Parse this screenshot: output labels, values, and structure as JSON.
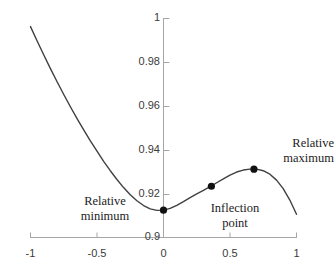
{
  "chart_data": {
    "type": "line",
    "title": "",
    "xlabel": "",
    "ylabel": "",
    "xlim": [
      -1,
      1
    ],
    "ylim": [
      0.9,
      1.0
    ],
    "grid": false,
    "legend": null,
    "xticks": [
      -1,
      -0.5,
      0,
      0.5,
      1
    ],
    "xtick_labels": [
      "-1",
      "-0.5",
      "0",
      "0.5",
      "1"
    ],
    "yticks": [
      0.9,
      0.92,
      0.94,
      0.96,
      0.98,
      1
    ],
    "ytick_labels": [
      "0.9",
      "0.92",
      "0.94",
      "0.96",
      "0.98",
      "1"
    ],
    "series": [
      {
        "name": "curve",
        "color": "#404040",
        "x": [
          -1.0,
          -0.95,
          -0.9,
          -0.85,
          -0.8,
          -0.75,
          -0.7,
          -0.65,
          -0.6,
          -0.55,
          -0.5,
          -0.45,
          -0.4,
          -0.35,
          -0.3,
          -0.25,
          -0.2,
          -0.15,
          -0.1,
          -0.05,
          0.0,
          0.05,
          0.1,
          0.15,
          0.2,
          0.25,
          0.3,
          0.35,
          0.4,
          0.45,
          0.5,
          0.55,
          0.6,
          0.65,
          0.7,
          0.75,
          0.8,
          0.85,
          0.9,
          0.95,
          1.0
        ],
        "y": [
          0.9963,
          0.9897,
          0.9833,
          0.9771,
          0.9711,
          0.9653,
          0.9597,
          0.9543,
          0.9491,
          0.9441,
          0.9394,
          0.9348,
          0.9305,
          0.9265,
          0.9228,
          0.9195,
          0.9168,
          0.9146,
          0.9131,
          0.9124,
          0.9125,
          0.9133,
          0.9147,
          0.9164,
          0.9182,
          0.9199,
          0.9215,
          0.9232,
          0.925,
          0.9268,
          0.9285,
          0.9299,
          0.9308,
          0.9312,
          0.9312,
          0.9305,
          0.9289,
          0.9262,
          0.9223,
          0.9171,
          0.9106
        ]
      }
    ],
    "points": [
      {
        "name": "relative-minimum",
        "x": 0.0,
        "y": 0.9125,
        "label": "Relative\nminimum",
        "label_line1": "Relative",
        "label_line2": "minimum"
      },
      {
        "name": "inflection-point",
        "x": 0.36,
        "y": 0.9234,
        "label": "Inflection\npoint",
        "label_line1": "Inflection",
        "label_line2": "point"
      },
      {
        "name": "relative-maximum",
        "x": 0.68,
        "y": 0.9312,
        "label": "Relative\nmaximum",
        "label_line1": "Relative",
        "label_line2": "maximum"
      }
    ],
    "annotations": [
      {
        "name": "relative-minimum-label",
        "line1": "Relative",
        "line2": "minimum"
      },
      {
        "name": "inflection-point-label",
        "line1": "Inflection",
        "line2": "point"
      },
      {
        "name": "relative-maximum-label",
        "line1": "Relative",
        "line2": "maximum"
      }
    ],
    "colors": {
      "curve": "#404040",
      "axis": "#a6a6a6",
      "marker": "#111111",
      "tick_text": "#3a3a3a",
      "annotation_text": "#1c1c1c",
      "background": "#ffffff"
    }
  },
  "ylabels": {
    "t0": "1",
    "t1": "0.98",
    "t2": "0.96",
    "t3": "0.94",
    "t4": "0.92",
    "t5": "0.9"
  },
  "xlabels": {
    "t0": "-1",
    "t1": "-0.5",
    "t2": "0",
    "t3": "0.5",
    "t4": "1"
  },
  "annotations": {
    "minimum": {
      "line1": "Relative",
      "line2": "minimum"
    },
    "inflection": {
      "line1": "Inflection",
      "line2": "point"
    },
    "maximum": {
      "line1": "Relative",
      "line2": "maximum"
    }
  }
}
